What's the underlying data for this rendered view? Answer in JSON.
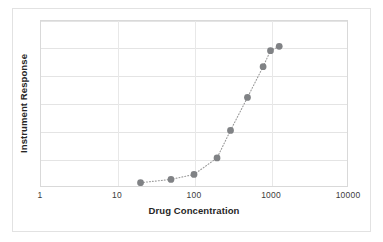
{
  "chart_data": {
    "type": "scatter",
    "title": "",
    "xlabel": "Drug Concentration",
    "ylabel": "Instrument Response",
    "xscale": "log",
    "yscale": "linear",
    "xlim": [
      1,
      10000
    ],
    "ylim": [
      0,
      6
    ],
    "xticks": [
      "1",
      "10",
      "100",
      "1000",
      "10000"
    ],
    "yticks": [],
    "grid": true,
    "legend": null,
    "marker_color": "#808285",
    "line_color": "#9a9a9a",
    "line_style": "dotted",
    "x": [
      20,
      50,
      100,
      200,
      300,
      500,
      800,
      1000,
      1300
    ],
    "y": [
      0.12,
      0.24,
      0.42,
      1.02,
      2.02,
      3.22,
      4.34,
      4.92,
      5.08
    ],
    "series": [
      {
        "name": "Dose response",
        "points": [
          {
            "x": 20,
            "y": 0.12
          },
          {
            "x": 50,
            "y": 0.24
          },
          {
            "x": 100,
            "y": 0.42
          },
          {
            "x": 200,
            "y": 1.02
          },
          {
            "x": 300,
            "y": 2.02
          },
          {
            "x": 500,
            "y": 3.22
          },
          {
            "x": 800,
            "y": 4.34
          },
          {
            "x": 1000,
            "y": 4.92
          },
          {
            "x": 1300,
            "y": 5.08
          }
        ]
      }
    ]
  },
  "axis": {
    "x_tick_labels": [
      "1",
      "10",
      "100",
      "1000",
      "10000"
    ],
    "x_title": "Drug Concentration",
    "y_title": "Instrument Response"
  }
}
